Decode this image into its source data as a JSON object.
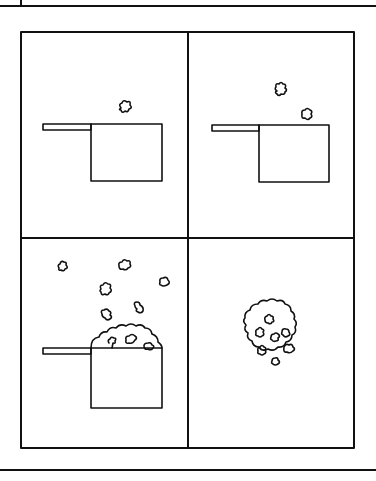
{
  "figure": {
    "panel_count": 4,
    "colors": {
      "ink": "#111111",
      "paper": "#ffffff"
    },
    "panels": [
      {
        "position": "top-left",
        "description": "saucepan with one popped kernel above",
        "kernels_in_air": 1
      },
      {
        "position": "top-right",
        "description": "saucepan with two popped kernels above",
        "kernels_in_air": 2
      },
      {
        "position": "bottom-left",
        "description": "saucepan overflowing with popcorn, many kernels flying",
        "kernels_in_air": 7
      },
      {
        "position": "bottom-right",
        "description": "pile of popcorn",
        "kernels_in_pile": 7
      }
    ]
  }
}
